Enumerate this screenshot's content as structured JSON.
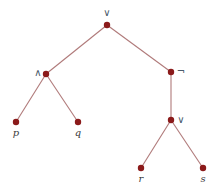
{
  "diagram": {
    "type": "expression-tree",
    "colors": {
      "edge": "#b07a7a",
      "node": "#8b1a1a",
      "operator_label": "#4a5a6a",
      "variable_label": "#3a3a3a"
    },
    "nodes": [
      {
        "id": "root",
        "label": "∨",
        "kind": "operator",
        "x": 107,
        "y": 25,
        "lx": 107,
        "ly": 16
      },
      {
        "id": "and",
        "label": "∧",
        "kind": "operator",
        "x": 46,
        "y": 74,
        "lx": 38,
        "ly": 76
      },
      {
        "id": "not",
        "label": "¬",
        "kind": "operator",
        "x": 171,
        "y": 72,
        "lx": 181,
        "ly": 75
      },
      {
        "id": "p",
        "label": "p",
        "kind": "variable",
        "x": 16,
        "y": 122,
        "lx": 16,
        "ly": 136
      },
      {
        "id": "q",
        "label": "q",
        "kind": "variable",
        "x": 78,
        "y": 122,
        "lx": 78,
        "ly": 136
      },
      {
        "id": "or2",
        "label": "∨",
        "kind": "operator",
        "x": 171,
        "y": 120,
        "lx": 181,
        "ly": 123
      },
      {
        "id": "r",
        "label": "r",
        "kind": "variable",
        "x": 141,
        "y": 168,
        "lx": 141,
        "ly": 182
      },
      {
        "id": "s",
        "label": "s",
        "kind": "variable",
        "x": 203,
        "y": 168,
        "lx": 203,
        "ly": 182
      }
    ],
    "edges": [
      [
        "root",
        "and"
      ],
      [
        "root",
        "not"
      ],
      [
        "and",
        "p"
      ],
      [
        "and",
        "q"
      ],
      [
        "not",
        "or2"
      ],
      [
        "or2",
        "r"
      ],
      [
        "or2",
        "s"
      ]
    ]
  }
}
